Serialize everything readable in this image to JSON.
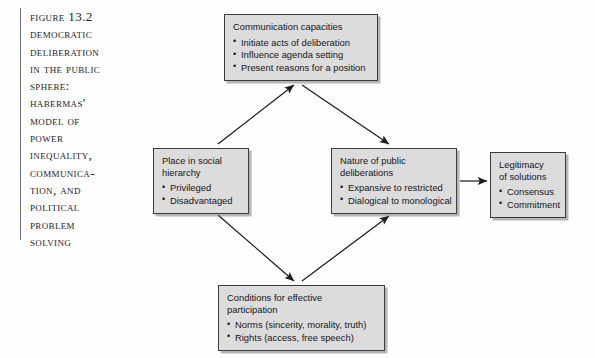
{
  "figure": {
    "caption": "Figure 13.2 Democratic Deliberation in the Public Sphere: Habermas' Model of Power Inequality, Communica-tion, and Political Problem Solving",
    "caption_lines": "Figure 13.2\nDemocratic\nDeliberation\nin the Public\nSphere:\nHabermas'\nModel of\nPower\nInequality,\nCommunica-\ntion, and\nPolitical\nProblem\nSolving"
  },
  "diagram": {
    "type": "flow",
    "box_fill": "#dcdcdc",
    "box_border": "#3a3a3f",
    "arrow_color": "#1d1d22",
    "nodes": [
      {
        "id": "communication",
        "title": "Communication capacities",
        "bullets": [
          "Initiate acts of deliberation",
          "Influence agenda setting",
          "Present reasons for a position"
        ]
      },
      {
        "id": "place",
        "title": "Place in social\nhierarchy",
        "bullets": [
          "Privileged",
          "Disadvantaged"
        ]
      },
      {
        "id": "nature",
        "title": "Nature of public\ndeliberations",
        "bullets": [
          "Expansive to restricted",
          "Dialogical to monological"
        ]
      },
      {
        "id": "legitimacy",
        "title": "Legitimacy\nof solutions",
        "bullets": [
          "Consensus",
          "Commitment"
        ]
      },
      {
        "id": "conditions",
        "title": "Conditions for effective\nparticipation",
        "bullets": [
          "Norms (sincerity, morality, truth)",
          "Rights (access, free speech)"
        ]
      }
    ],
    "edges": [
      {
        "from": "place",
        "to": "communication",
        "direction": "up-right"
      },
      {
        "from": "communication",
        "to": "nature",
        "direction": "down-right"
      },
      {
        "from": "place",
        "to": "conditions",
        "direction": "down-right"
      },
      {
        "from": "conditions",
        "to": "nature",
        "direction": "up-right"
      },
      {
        "from": "nature",
        "to": "legitimacy",
        "direction": "right"
      }
    ]
  }
}
